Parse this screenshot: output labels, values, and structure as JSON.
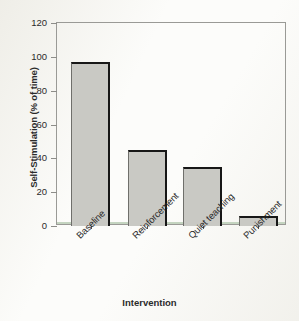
{
  "chart_data": {
    "type": "bar",
    "title": "",
    "categories": [
      "Baseline",
      "Reinforcement",
      "Quiet teaching",
      "Punishment"
    ],
    "values": [
      97,
      45,
      35,
      6
    ],
    "xlabel": "Intervention",
    "ylabel": "Self-Stimulation (% of time)",
    "ylim": [
      0,
      120
    ],
    "yticks": [
      0,
      20,
      40,
      60,
      80,
      100,
      120
    ],
    "ytick_labels": [
      "0",
      "20",
      "40",
      "60",
      "80",
      "100",
      "120"
    ],
    "grid": false,
    "legend": null,
    "bar_fill_color": "#c9c9c4",
    "bar_edge_color": "#171717",
    "frame_color": "#9a9a96",
    "background_color": "#fcfcfa",
    "xtick_label_rotation": -45
  }
}
